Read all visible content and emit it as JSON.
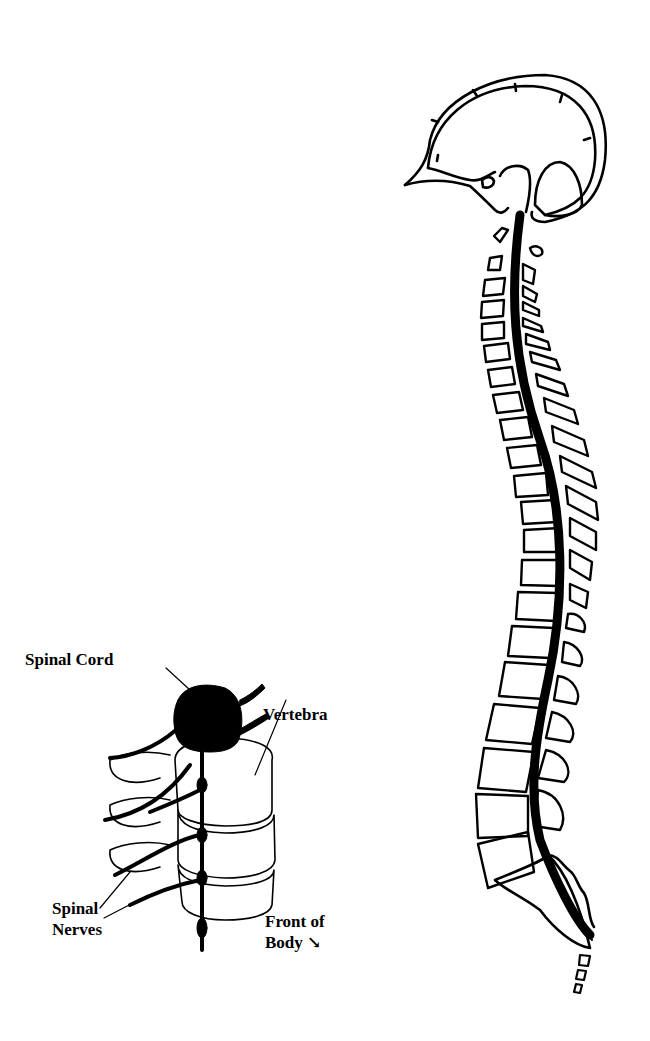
{
  "figure": {
    "colors": {
      "ink": "#000000",
      "background": "#ffffff"
    }
  },
  "detail_view": {
    "labels": {
      "spinal_cord": "Spinal Cord",
      "vertebra": "Vertebra",
      "spinal_nerves_line1": "Spinal",
      "spinal_nerves_line2": "Nerves",
      "front_of_body_line1": "Front of",
      "front_of_body_line2": "Body ↘"
    }
  },
  "spine_view": {
    "parts": [
      "skull",
      "brain",
      "spinal-cord",
      "vertebrae",
      "sacrum",
      "coccyx"
    ]
  }
}
